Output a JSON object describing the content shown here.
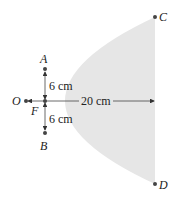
{
  "diagram": {
    "points": {
      "O": "O",
      "F": "F",
      "A": "A",
      "B": "B",
      "C": "C",
      "D": "D"
    },
    "dimensions": {
      "upper": "6 cm",
      "lower": "6 cm",
      "axis": "20 cm"
    },
    "colors": {
      "fill": "#e6e6e6",
      "ink": "#333333"
    }
  }
}
